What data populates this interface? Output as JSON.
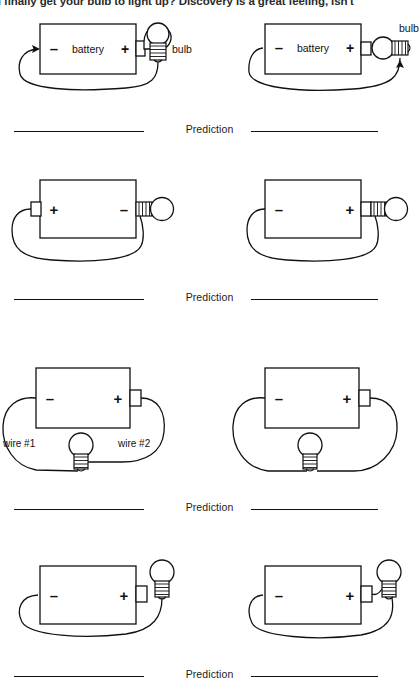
{
  "document": {
    "type": "worksheet",
    "top_text": "u finally get your bulb to light up? Discovery is a great feeling, isn't",
    "prediction_label": "Prediction",
    "labels": {
      "battery": "battery",
      "bulb": "bulb",
      "plus": "+",
      "minus": "–",
      "wire1": "wire #1",
      "wire2": "wire #2"
    },
    "colors": {
      "ink": "#111111",
      "paper": "#ffffff"
    }
  },
  "rows": [
    {
      "index": 1,
      "prediction_label": "Prediction",
      "circuits": [
        {
          "id": "circuit-1a",
          "battery_left_terminal": "–",
          "battery_right_terminal": "+",
          "battery_label": "battery",
          "bulb_label": "bulb",
          "bulb_orientation": "vertical",
          "terminal_nub_side": "right",
          "has_arrow": true
        },
        {
          "id": "circuit-1b",
          "battery_left_terminal": "–",
          "battery_right_terminal": "+",
          "battery_label": "battery",
          "bulb_label": "bulb",
          "bulb_orientation": "horizontal",
          "terminal_nub_side": "right",
          "has_arrow": true
        }
      ]
    },
    {
      "index": 2,
      "prediction_label": "Prediction",
      "circuits": [
        {
          "id": "circuit-2a",
          "battery_left_terminal": "+",
          "battery_right_terminal": "–",
          "battery_label": "",
          "bulb_label": "",
          "bulb_orientation": "horizontal",
          "terminal_nub_side": "left",
          "has_arrow": false
        },
        {
          "id": "circuit-2b",
          "battery_left_terminal": "–",
          "battery_right_terminal": "+",
          "battery_label": "",
          "bulb_label": "",
          "bulb_orientation": "horizontal",
          "terminal_nub_side": "right",
          "has_arrow": false
        }
      ]
    },
    {
      "index": 3,
      "prediction_label": "Prediction",
      "circuits": [
        {
          "id": "circuit-3a",
          "battery_left_terminal": "–",
          "battery_right_terminal": "+",
          "battery_label": "",
          "bulb_label": "",
          "bulb_orientation": "below",
          "terminal_nub_side": "right",
          "wire1_label": "wire #1",
          "wire2_label": "wire #2",
          "has_arrow": false
        },
        {
          "id": "circuit-3b",
          "battery_left_terminal": "–",
          "battery_right_terminal": "+",
          "battery_label": "",
          "bulb_label": "",
          "bulb_orientation": "below",
          "terminal_nub_side": "right",
          "wire1_label": "",
          "wire2_label": "",
          "has_arrow": false
        }
      ]
    },
    {
      "index": 4,
      "prediction_label": "Prediction",
      "circuits": [
        {
          "id": "circuit-4a",
          "battery_left_terminal": "–",
          "battery_right_terminal": "+",
          "battery_label": "",
          "bulb_label": "",
          "bulb_orientation": "upper-right",
          "terminal_nub_side": "right",
          "has_arrow": false
        },
        {
          "id": "circuit-4b",
          "battery_left_terminal": "–",
          "battery_right_terminal": "+",
          "battery_label": "",
          "bulb_label": "",
          "bulb_orientation": "upper-right",
          "terminal_nub_side": "right",
          "has_arrow": false
        }
      ]
    }
  ]
}
